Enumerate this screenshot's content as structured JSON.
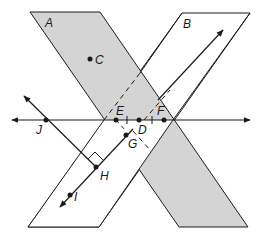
{
  "diagram": {
    "colors": {
      "plane_a_fill": "#d4d4d4",
      "plane_b_fill": "#ffffff",
      "stroke": "#1a1a1a",
      "background": "#ffffff"
    },
    "planes": [
      {
        "name": "A",
        "label": "A",
        "shaded": true
      },
      {
        "name": "B",
        "label": "B",
        "shaded": false
      }
    ],
    "points": [
      {
        "name": "C",
        "label": "C"
      },
      {
        "name": "E",
        "label": "E"
      },
      {
        "name": "D",
        "label": "D"
      },
      {
        "name": "F",
        "label": "F"
      },
      {
        "name": "G",
        "label": "G"
      },
      {
        "name": "H",
        "label": "H"
      },
      {
        "name": "I",
        "label": "I"
      },
      {
        "name": "J",
        "label": "J"
      }
    ],
    "annotations": {
      "right_angle_at": "H",
      "congruent_ticks": "ED ≅ DF",
      "dashed_line": "intersection of planes A and B (hidden part)"
    }
  }
}
